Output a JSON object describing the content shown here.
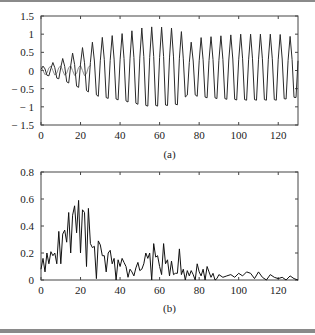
{
  "chart_data": [
    {
      "type": "line",
      "panel": "a",
      "caption": "(a)",
      "title": "",
      "xlabel": "",
      "ylabel": "",
      "xlim": [
        0,
        130
      ],
      "ylim": [
        -1.5,
        1.5
      ],
      "xticks": [
        0,
        20,
        40,
        60,
        80,
        100,
        120
      ],
      "yticks": [
        -1.5,
        -1,
        -0.5,
        0,
        0.5,
        1,
        1.5
      ],
      "ytick_labels": [
        "− 1.5",
        "− 1",
        "− 0.5",
        "0",
        "0.5",
        "1",
        "1.5"
      ],
      "grid": false,
      "legend": null,
      "series": [
        {
          "name": "signal (dark, growing amplitude)",
          "color": "#222222",
          "description": "oscillation with period ~5 samples; amplitude grows from ~0.1 at x=0 to ~1.0 by x≈35, peaks ~1.2 near x=53-70, then ~0.9-1.0 to x=130",
          "envelope": [
            [
              0,
              0.1
            ],
            [
              10,
              0.3
            ],
            [
              20,
              0.6
            ],
            [
              30,
              0.9
            ],
            [
              40,
              1.0
            ],
            [
              53,
              1.2
            ],
            [
              60,
              1.2
            ],
            [
              70,
              1.15
            ],
            [
              75,
              0.75
            ],
            [
              80,
              0.9
            ],
            [
              100,
              1.0
            ],
            [
              120,
              1.0
            ],
            [
              130,
              0.9
            ]
          ]
        },
        {
          "name": "reference (gray, small amplitude)",
          "color": "#888888",
          "description": "low-amplitude oscillation ~±0.15 for x in 0..25, then overlaps the dark series",
          "envelope": [
            [
              0,
              0.12
            ],
            [
              25,
              0.15
            ]
          ]
        }
      ]
    },
    {
      "type": "line",
      "panel": "b",
      "caption": "(b)",
      "title": "",
      "xlabel": "",
      "ylabel": "",
      "xlim": [
        0,
        130
      ],
      "ylim": [
        0,
        0.8
      ],
      "xticks": [
        0,
        20,
        40,
        60,
        80,
        100,
        120
      ],
      "yticks": [
        0,
        0.2,
        0.4,
        0.6,
        0.8
      ],
      "ytick_labels": [
        "0",
        "0.2",
        "0.4",
        "0.6",
        "0.8"
      ],
      "grid": false,
      "legend": null,
      "series": [
        {
          "name": "spectrum",
          "color": "#111111",
          "x": [
            0,
            1,
            2,
            3,
            4,
            5,
            6,
            7,
            8,
            9,
            10,
            11,
            12,
            13,
            14,
            15,
            16,
            17,
            18,
            19,
            20,
            21,
            22,
            23,
            24,
            25,
            26,
            27,
            28,
            29,
            30,
            31,
            32,
            33,
            34,
            35,
            36,
            37,
            38,
            39,
            40,
            41,
            42,
            43,
            44,
            45,
            46,
            47,
            48,
            49,
            50,
            51,
            52,
            53,
            54,
            55,
            56,
            57,
            58,
            59,
            60,
            61,
            62,
            63,
            64,
            65,
            66,
            67,
            68,
            69,
            70,
            71,
            72,
            73,
            74,
            75,
            76,
            77,
            78,
            79,
            80,
            81,
            82,
            83,
            84,
            85,
            86,
            87,
            88,
            89,
            90,
            92,
            94,
            96,
            98,
            100,
            102,
            104,
            106,
            108,
            110,
            112,
            114,
            116,
            118,
            120,
            122,
            124,
            126,
            128,
            130
          ],
          "values": [
            0.08,
            0.16,
            0.06,
            0.2,
            0.12,
            0.21,
            0.18,
            0.2,
            0.12,
            0.36,
            0.12,
            0.34,
            0.37,
            0.28,
            0.5,
            0.2,
            0.48,
            0.55,
            0.35,
            0.59,
            0.2,
            0.52,
            0.5,
            0.1,
            0.53,
            0.27,
            0.24,
            0.25,
            0.01,
            0.29,
            0.26,
            0.18,
            0.18,
            0.06,
            0.2,
            0.22,
            0.12,
            0.16,
            0.0,
            0.15,
            0.1,
            0.16,
            0.13,
            0.1,
            0.02,
            0.08,
            0.06,
            0.03,
            0.09,
            0.13,
            0.07,
            0.08,
            0.12,
            0.2,
            0.16,
            0.2,
            0.0,
            0.27,
            0.17,
            0.18,
            0.1,
            0.04,
            0.27,
            0.12,
            0.15,
            0.03,
            0.14,
            0.04,
            0.05,
            0.05,
            0.23,
            0.04,
            0.08,
            0.0,
            0.07,
            0.03,
            0.07,
            0.04,
            0.0,
            0.12,
            0.06,
            0.03,
            0.08,
            0.0,
            0.1,
            0.06,
            0.02,
            0.05,
            0.0,
            0.01,
            0.04,
            0.02,
            0.03,
            0.04,
            0.02,
            0.05,
            0.03,
            0.06,
            0.05,
            0.01,
            0.06,
            0.02,
            0.0,
            0.04,
            0.02,
            0.01,
            0.02,
            0.0,
            0.03,
            0.01,
            0.0
          ]
        }
      ]
    }
  ]
}
